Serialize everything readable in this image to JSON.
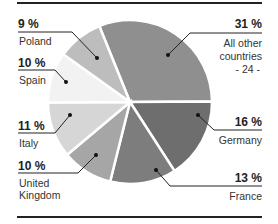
{
  "chart_data": {
    "type": "pie",
    "title": "",
    "legend": "none",
    "slices": [
      {
        "label": "All other countries - 24 -",
        "name": "All other countries",
        "note": "- 24 -",
        "value": 31,
        "pct_label": "31 %",
        "color": "#8f8f8f"
      },
      {
        "label": "Germany",
        "value": 16,
        "pct_label": "16 %",
        "color": "#6e6e6e"
      },
      {
        "label": "France",
        "value": 13,
        "pct_label": "13 %",
        "color": "#7d7d7d"
      },
      {
        "label": "United Kingdom",
        "value": 10,
        "pct_label": "10 %",
        "color": "#a6a6a6"
      },
      {
        "label": "Italy",
        "value": 11,
        "pct_label": "11 %",
        "color": "#d6d6d6"
      },
      {
        "label": "Spain",
        "value": 10,
        "pct_label": "10 %",
        "color": "#f2f2f2"
      },
      {
        "label": "Poland",
        "value": 9,
        "pct_label": "9 %",
        "color": "#bdbdbd"
      }
    ]
  },
  "labels": {
    "poland": {
      "pct": "9 %",
      "name": "Poland"
    },
    "spain": {
      "pct": "10 %",
      "name": "Spain"
    },
    "italy": {
      "pct": "11 %",
      "name": "Italy"
    },
    "uk": {
      "pct": "10 %",
      "name_line1": "United",
      "name_line2": "Kingdom"
    },
    "others": {
      "pct": "31 %",
      "name_line1": "All other",
      "name_line2": "countries",
      "note": "- 24 -"
    },
    "germany": {
      "pct": "16 %",
      "name": "Germany"
    },
    "france": {
      "pct": "13 %",
      "name": "France"
    }
  }
}
